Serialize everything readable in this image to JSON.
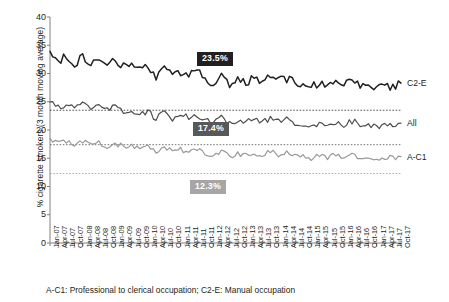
{
  "chart_data": {
    "type": "line",
    "title": "",
    "xlabel": "",
    "ylabel": "% cigarette smokers (3 month moving average)",
    "ylim": [
      0,
      40
    ],
    "yticks": [
      0,
      5,
      10,
      15,
      20,
      25,
      30,
      35,
      40
    ],
    "grid": false,
    "legend_position": "right-inline",
    "caption": "A-C1: Professional to clerical occupation; C2-E: Manual occupation",
    "categories": [
      "Jan-07",
      "Apr-07",
      "Jul-07",
      "Oct-07",
      "Jan-08",
      "Apr-08",
      "Jul-08",
      "Oct-08",
      "Jan-09",
      "Apr-09",
      "Jul-09",
      "Oct-09",
      "Jan-10",
      "Apr-10",
      "Jul-10",
      "Oct-10",
      "Jan-11",
      "Apr-11",
      "Jul-11",
      "Oct-11",
      "Jan-12",
      "Apr-12",
      "Jul-12",
      "Oct-12",
      "Jan-13",
      "Apr-13",
      "Jul-13",
      "Oct-13",
      "Jan-14",
      "Apr-14",
      "Jul-14",
      "Oct-14",
      "Jan-15",
      "Apr-15",
      "Jul-15",
      "Oct-15",
      "Jan-16",
      "Apr-16",
      "Jul-16",
      "Oct-16",
      "Jan-17",
      "Apr-17",
      "Jul-17",
      "Oct-17"
    ],
    "series": [
      {
        "name": "C2-E",
        "color": "#231f20",
        "label": "C2-E",
        "reference_value": 23.5,
        "reference_label": "23.5%",
        "values": [
          33.9,
          32.0,
          33.2,
          31.6,
          33.0,
          31.4,
          32.5,
          31.3,
          32.4,
          31.2,
          31.7,
          30.7,
          31.2,
          29.0,
          31.3,
          29.6,
          30.3,
          29.7,
          30.3,
          29.4,
          28.0,
          30.1,
          28.0,
          29.2,
          28.2,
          29.4,
          28.5,
          29.5,
          28.7,
          29.1,
          28.3,
          28.0,
          27.6,
          28.4,
          27.7,
          28.5,
          27.9,
          28.6,
          28.0,
          27.4,
          27.2,
          28.2,
          27.4,
          28.3
        ]
      },
      {
        "name": "All",
        "color": "#4d4d4d",
        "label": "All",
        "reference_value": 17.4,
        "reference_label": "17.4%",
        "values": [
          25.0,
          24.1,
          24.6,
          23.7,
          24.5,
          23.6,
          24.2,
          23.4,
          24.1,
          23.3,
          23.5,
          23.0,
          23.3,
          21.9,
          23.1,
          22.1,
          22.6,
          22.2,
          22.5,
          22.0,
          21.2,
          22.4,
          21.2,
          21.9,
          21.3,
          22.0,
          21.5,
          22.1,
          21.6,
          21.8,
          21.3,
          21.1,
          20.8,
          21.3,
          20.9,
          21.4,
          21.0,
          21.5,
          21.1,
          20.7,
          20.6,
          21.2,
          20.7,
          21.2
        ]
      },
      {
        "name": "A-C1",
        "color": "#9a9a9a",
        "label": "A-C1",
        "reference_value": 12.3,
        "reference_label": "12.3%",
        "values": [
          18.3,
          17.6,
          18.0,
          17.3,
          17.9,
          17.2,
          17.7,
          17.1,
          17.6,
          17.0,
          17.2,
          16.7,
          17.0,
          15.9,
          16.9,
          16.1,
          16.5,
          16.2,
          16.4,
          16.0,
          15.3,
          16.3,
          15.4,
          15.9,
          15.5,
          16.0,
          15.6,
          16.1,
          15.7,
          15.9,
          15.5,
          15.3,
          15.0,
          15.4,
          15.1,
          15.5,
          15.2,
          15.6,
          15.3,
          14.9,
          14.8,
          15.3,
          14.9,
          15.3
        ]
      }
    ],
    "callouts": [
      {
        "value": "23.5%",
        "bg": "#231f20",
        "fg": "#ffffff"
      },
      {
        "value": "17.4%",
        "bg": "#585858",
        "fg": "#ffffff"
      },
      {
        "value": "12.3%",
        "bg": "#a6a6a6",
        "fg": "#ffffff"
      }
    ]
  }
}
